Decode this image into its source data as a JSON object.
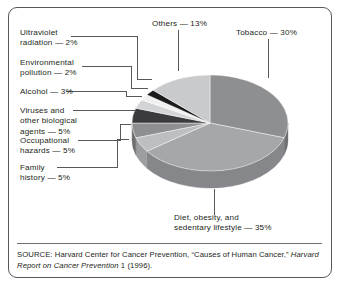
{
  "figure": {
    "frame_color": "#58585a",
    "background": "#ffffff",
    "text_color": "#231f20"
  },
  "source": {
    "prefix": "SOURCE: Harvard Center for Cancer Prevention, “Causes of Human Cancer,” ",
    "italic": "Harvard Report on Cancer Prevention",
    "suffix": " 1 (1996)."
  },
  "labels": {
    "ultraviolet": "Ultraviolet\nradiation — 2%",
    "ultraviolet_l1": "Ultraviolet",
    "ultraviolet_l2": "radiation — 2%",
    "environmental_l1": "Environmental",
    "environmental_l2": "pollution — 2%",
    "alcohol_l1": "Alcohol — 3%",
    "viruses_l1": "Viruses and",
    "viruses_l2": "other biological",
    "viruses_l3": "agents — 5%",
    "occupational_l1": "Occupational",
    "occupational_l2": "hazards — 5%",
    "family_l1": "Family",
    "family_l2": "history — 5%",
    "others_l1": "Others — 13%",
    "tobacco_l1": "Tobacco — 30%",
    "diet_l1": "Diet, obesity, and",
    "diet_l2": "sedentary lifestyle — 35%"
  },
  "chart_data": {
    "type": "pie",
    "title": "",
    "subtitle": "",
    "xlabel": "",
    "ylabel": "",
    "legend_position": "callout-labels",
    "grid": false,
    "units": "percent",
    "total": 100,
    "three_d": true,
    "start_angle_deg": -90,
    "direction": "clockwise",
    "categories": [
      "Tobacco",
      "Diet, obesity, and sedentary lifestyle",
      "Family history",
      "Occupational hazards",
      "Viruses and other biological agents",
      "Alcohol",
      "Environmental pollution",
      "Ultraviolet radiation",
      "Others"
    ],
    "values": [
      30,
      35,
      5,
      5,
      5,
      3,
      2,
      2,
      13
    ],
    "slices": [
      {
        "label": "Tobacco",
        "value": 30,
        "display": "Tobacco — 30%",
        "color": "#8e8f91",
        "side_color": "#6e6f71"
      },
      {
        "label": "Diet, obesity, and sedentary lifestyle",
        "value": 35,
        "display": "Diet, obesity, and sedentary lifestyle — 35%",
        "color": "#a6a7a9",
        "side_color": "#86878a"
      },
      {
        "label": "Family history",
        "value": 5,
        "display": "Family history — 5%",
        "color": "#bdbec0",
        "side_color": "#9d9ea0"
      },
      {
        "label": "Occupational hazards",
        "value": 5,
        "display": "Occupational hazards — 5%",
        "color": "#8e8f91",
        "side_color": "#6e6f71"
      },
      {
        "label": "Viruses and other biological agents",
        "value": 5,
        "display": "Viruses and other biological agents — 5%",
        "color": "#3b3b3d",
        "side_color": "#262627"
      },
      {
        "label": "Alcohol",
        "value": 3,
        "display": "Alcohol — 3%",
        "color": "#d3d4d6",
        "side_color": "#b3b4b6"
      },
      {
        "label": "Environmental pollution",
        "value": 2,
        "display": "Environmental pollution — 2%",
        "color": "#f1f1f2",
        "side_color": "#d1d1d2"
      },
      {
        "label": "Ultraviolet radiation",
        "value": 2,
        "display": "Ultraviolet radiation — 2%",
        "color": "#1b1b1d",
        "side_color": "#0d0d0e"
      },
      {
        "label": "Others",
        "value": 13,
        "display": "Others — 13%",
        "color": "#c9cacc",
        "side_color": "#a9aaac"
      }
    ]
  }
}
